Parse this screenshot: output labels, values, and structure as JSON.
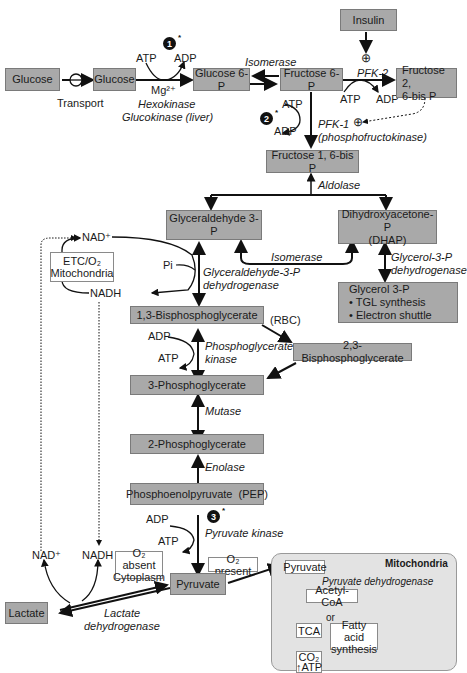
{
  "diagram": {
    "nodes": {
      "insulin": "Insulin",
      "glucose_ext": "Glucose",
      "glucose_int": "Glucose",
      "glucose6p": "Glucose 6-P",
      "fructose6p": "Fructose 6-P",
      "fructose26bp_l1": "Fructose 2,",
      "fructose26bp_l2": "6-bis P",
      "fructose16bp": "Fructose 1, 6-bis P",
      "g3p": "Glyceraldehyde 3-P",
      "dhap_l1": "Dihydroxyacetone-P",
      "dhap_l2": "(DHAP)",
      "glycerol3p": "Glycerol 3-P",
      "glycerol3p_b1": "• TGL synthesis",
      "glycerol3p_b2": "• Electron shuttle",
      "bpg13": "1,3-Bisphosphoglycerate",
      "bpg23": "2,3-Bisphosphoglycerate",
      "pg3": "3-Phosphoglycerate",
      "pg2": "2-Phosphoglycerate",
      "pep": "Phosphoenolpyruvate  (PEP)",
      "pyruvate": "Pyruvate",
      "lactate": "Lactate",
      "etc_l1": "ETC/O₂",
      "etc_l2": "Mitochondria",
      "o2_absent_l1": "O₂ absent",
      "o2_absent_l2": "Cytoplasm",
      "o2_present": "O₂ present"
    },
    "mitochondria": {
      "title": "Mitochondria",
      "pyruvate": "Pyruvate",
      "enzyme": "Pyruvate dehydrogenase",
      "acetyl_coa": "Acetyl-CoA",
      "or": "or",
      "tca": "TCA",
      "fatty_l1": "Fatty acid",
      "fatty_l2": "synthesis",
      "co2": "CO₂",
      "atp": "↑ATP"
    },
    "labels": {
      "transport": "Transport",
      "atp": "ATP",
      "adp": "ADP",
      "mg": "Mg²⁺",
      "hexokinase": "Hexokinase",
      "glucokinase": "Glucokinase (liver)",
      "isomerase": "Isomerase",
      "pfk2": "PFK-2",
      "pfk1": "PFK-1",
      "pfk1_full": "(phosphofructokinase)",
      "aldolase": "Aldolase",
      "tpi": "Isomerase",
      "g3pdh_l1": "Glycerol-3-P",
      "g3pdh_l2": "dehydrogenase",
      "gapdh_l1": "Glyceraldehyde-3-P",
      "gapdh_l2": "dehydrogenase",
      "pi": "Pi",
      "nad_plus": "NAD⁺",
      "nadh": "NADH",
      "rbc": "(RBC)",
      "pgk_l1": "Phosphoglycerate",
      "pgk_l2": "kinase",
      "mutase": "Mutase",
      "enolase": "Enolase",
      "pk": "Pyruvate kinase",
      "ldh_l1": "Lactate",
      "ldh_l2": "dehydrogenase",
      "plus": "⊕"
    },
    "steps": [
      "1",
      "2",
      "3"
    ],
    "step_mark": "*",
    "colors": {
      "box_fill": "#a9a9a9",
      "mito_fill": "#e3e3e3",
      "line": "#111111"
    }
  }
}
